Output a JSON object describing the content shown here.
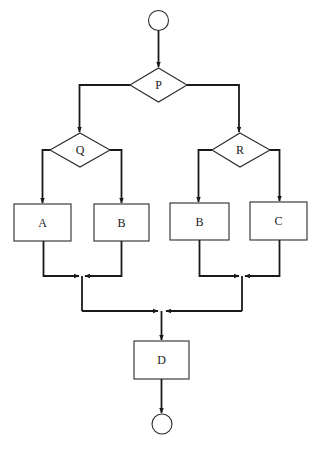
{
  "diagram": {
    "type": "flowchart",
    "nodes": {
      "start": {
        "kind": "terminal-circle",
        "label": ""
      },
      "P": {
        "kind": "decision",
        "label": "P"
      },
      "Q": {
        "kind": "decision",
        "label": "Q"
      },
      "R": {
        "kind": "decision",
        "label": "R"
      },
      "A": {
        "kind": "process",
        "label": "A"
      },
      "B_left": {
        "kind": "process",
        "label": "B"
      },
      "B_right": {
        "kind": "process",
        "label": "B"
      },
      "C": {
        "kind": "process",
        "label": "C"
      },
      "D": {
        "kind": "process",
        "label": "D"
      },
      "end": {
        "kind": "terminal-circle",
        "label": ""
      }
    },
    "edges": [
      [
        "start",
        "P"
      ],
      [
        "P",
        "Q"
      ],
      [
        "P",
        "R"
      ],
      [
        "Q",
        "A"
      ],
      [
        "Q",
        "B_left"
      ],
      [
        "R",
        "B_right"
      ],
      [
        "R",
        "C"
      ],
      [
        "A",
        "merge_left"
      ],
      [
        "B_left",
        "merge_left"
      ],
      [
        "B_right",
        "merge_right"
      ],
      [
        "C",
        "merge_right"
      ],
      [
        "merge_left",
        "merge_final"
      ],
      [
        "merge_right",
        "merge_final"
      ],
      [
        "merge_final",
        "D"
      ],
      [
        "D",
        "end"
      ]
    ]
  }
}
